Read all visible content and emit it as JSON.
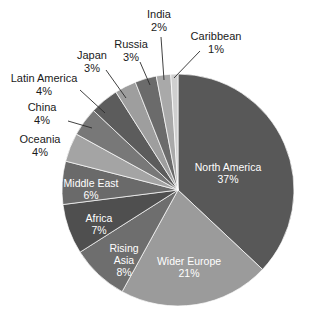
{
  "chart_data": {
    "type": "pie",
    "title": "",
    "subtitle": "",
    "xlabel": "",
    "ylabel": "",
    "legend_position": "none",
    "grid": false,
    "start_angle_deg": 0,
    "direction": "clockwise",
    "units": "percent",
    "total": 100,
    "categories": [
      "North America",
      "Wider Europe",
      "Rising Asia",
      "Africa",
      "Middle East",
      "Oceania",
      "China",
      "Latin America",
      "Japan",
      "Russia",
      "India",
      "Caribbean"
    ],
    "values": [
      37,
      21,
      8,
      7,
      6,
      4,
      4,
      4,
      3,
      3,
      2,
      1
    ],
    "value_labels": [
      "37%",
      "21%",
      "8%",
      "7%",
      "6%",
      "4%",
      "4%",
      "4%",
      "3%",
      "3%",
      "2%",
      "1%"
    ],
    "colors": [
      "#585858",
      "#9b9b9b",
      "#6e6e6e",
      "#4f4f4f",
      "#6a6a6a",
      "#a4a4a4",
      "#787878",
      "#5c5c5c",
      "#9e9e9e",
      "#6b6b6b",
      "#a9a9a9",
      "#cfcfcf"
    ],
    "slices": [
      {
        "name": "North America",
        "value": 37,
        "value_label": "37%",
        "color": "#585858",
        "label_placement": "inside",
        "label_color": "#ffffff",
        "label_x": 228,
        "label_y": 171,
        "pct_x": 228,
        "pct_y": 183
      },
      {
        "name": "Wider Europe",
        "value": 21,
        "value_label": "21%",
        "color": "#9b9b9b",
        "label_placement": "inside",
        "label_color": "#ffffff",
        "label_x": 189,
        "label_y": 265,
        "pct_x": 189,
        "pct_y": 277
      },
      {
        "name": "Rising Asia",
        "value": 8,
        "value_label": "8%",
        "color": "#6e6e6e",
        "label_placement": "inside",
        "label_color": "#ffffff",
        "label_x": 124,
        "label_y": 252,
        "pct_x": 124,
        "pct_y": 276,
        "label_line2": "Asia",
        "label_line1": "Rising"
      },
      {
        "name": "Africa",
        "value": 7,
        "value_label": "7%",
        "color": "#4f4f4f",
        "label_placement": "inside",
        "label_color": "#ffffff",
        "label_x": 99,
        "label_y": 222,
        "pct_x": 99,
        "pct_y": 234
      },
      {
        "name": "Middle East",
        "value": 6,
        "value_label": "6%",
        "color": "#6a6a6a",
        "label_placement": "inside",
        "label_color": "#ffffff",
        "label_x": 91,
        "label_y": 187,
        "pct_x": 91,
        "pct_y": 199
      },
      {
        "name": "Oceania",
        "value": 4,
        "value_label": "4%",
        "color": "#a4a4a4",
        "label_placement": "outside",
        "label_color": "#1a1a1a",
        "label_x": 40,
        "label_y": 143,
        "pct_x": 40,
        "pct_y": 156,
        "leader": false
      },
      {
        "name": "China",
        "value": 4,
        "value_label": "4%",
        "color": "#787878",
        "label_placement": "outside",
        "label_color": "#1a1a1a",
        "label_x": 42,
        "label_y": 111,
        "pct_x": 42,
        "pct_y": 124,
        "leader": true,
        "leader_x1": 68,
        "leader_y1": 121,
        "leader_x2": 92,
        "leader_y2": 128
      },
      {
        "name": "Latin America",
        "value": 4,
        "value_label": "4%",
        "color": "#5c5c5c",
        "label_placement": "outside",
        "label_color": "#1a1a1a",
        "label_x": 44,
        "label_y": 82,
        "pct_x": 44,
        "pct_y": 95,
        "leader": true,
        "leader_x1": 80,
        "leader_y1": 90,
        "leader_x2": 105,
        "leader_y2": 113
      },
      {
        "name": "Japan",
        "value": 3,
        "value_label": "3%",
        "color": "#9e9e9e",
        "label_placement": "outside",
        "label_color": "#1a1a1a",
        "label_x": 92,
        "label_y": 59,
        "pct_x": 92,
        "pct_y": 72,
        "leader": true,
        "leader_x1": 106,
        "leader_y1": 70,
        "leader_x2": 126,
        "leader_y2": 98
      },
      {
        "name": "Russia",
        "value": 3,
        "value_label": "3%",
        "color": "#6b6b6b",
        "label_placement": "outside",
        "label_color": "#1a1a1a",
        "label_x": 131,
        "label_y": 48,
        "pct_x": 131,
        "pct_y": 61,
        "leader": true,
        "leader_x1": 140,
        "leader_y1": 62,
        "leader_x2": 150,
        "leader_y2": 85
      },
      {
        "name": "India",
        "value": 2,
        "value_label": "2%",
        "color": "#a9a9a9",
        "label_placement": "outside",
        "label_color": "#1a1a1a",
        "label_x": 159,
        "label_y": 18,
        "pct_x": 159,
        "pct_y": 31,
        "leader": true,
        "leader_x1": 161,
        "leader_y1": 37,
        "leader_x2": 164,
        "leader_y2": 80
      },
      {
        "name": "Caribbean",
        "value": 1,
        "value_label": "1%",
        "color": "#cfcfcf",
        "label_placement": "outside",
        "label_color": "#1a1a1a",
        "label_x": 216,
        "label_y": 40,
        "pct_x": 216,
        "pct_y": 53,
        "leader": true,
        "leader_x1": 200,
        "leader_y1": 51,
        "leader_x2": 174,
        "leader_y2": 78
      }
    ],
    "geometry": {
      "center_x": 178,
      "center_y": 190,
      "radius": 116
    }
  }
}
